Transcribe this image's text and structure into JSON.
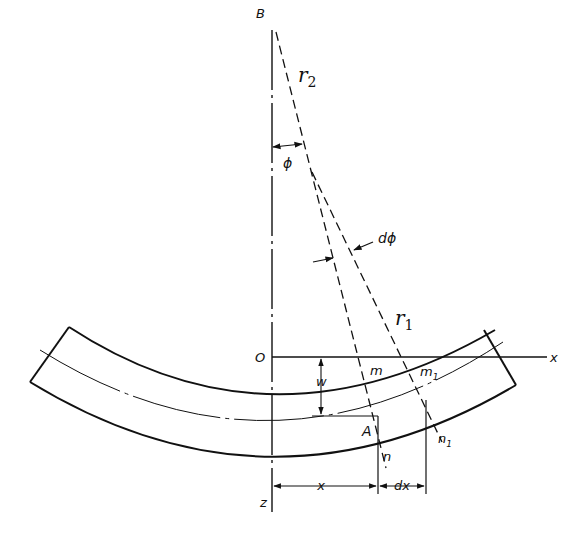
{
  "diagram": {
    "type": "beam-bending-geometry",
    "labels": {
      "B": "B",
      "r2": "r",
      "r2_sub": "2",
      "phi": "ϕ",
      "dphi": "dϕ",
      "r1": "r",
      "r1_sub": "1",
      "O": "O",
      "x_axis": "x",
      "z_axis": "z",
      "w": "w",
      "m": "m",
      "m1": "m",
      "m1_sub": "1",
      "A": "A",
      "n": "n",
      "n1": "n",
      "n1_sub": "1",
      "x_dim": "x",
      "dx_dim": "dx"
    },
    "colors": {
      "ink": "#111111",
      "background": "#ffffff"
    }
  }
}
